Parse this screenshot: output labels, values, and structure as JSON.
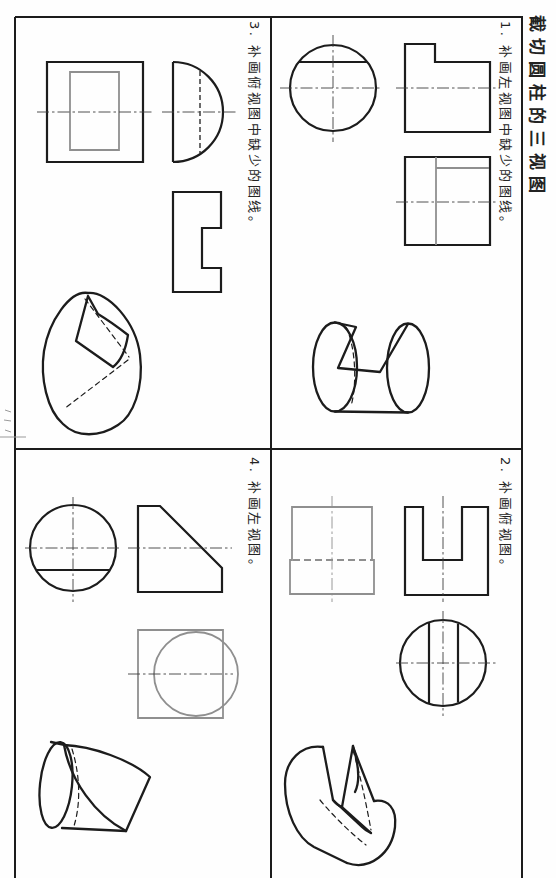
{
  "page": {
    "title": "截切圆柱的三视图"
  },
  "exercises": [
    {
      "id": "1",
      "label": "1. 补画左视图中缺少的图线。"
    },
    {
      "id": "2",
      "label": "2. 补画俯视图。"
    },
    {
      "id": "3",
      "label": "3. 补画俯视图中缺少的图线。"
    },
    {
      "id": "4",
      "label": "4. 补画左视图。"
    }
  ],
  "colors": {
    "ink": "#1c1c1c",
    "answer_line": "#8f8f8f",
    "centerline": "#3f3f3f",
    "paper": "#fefefe"
  }
}
